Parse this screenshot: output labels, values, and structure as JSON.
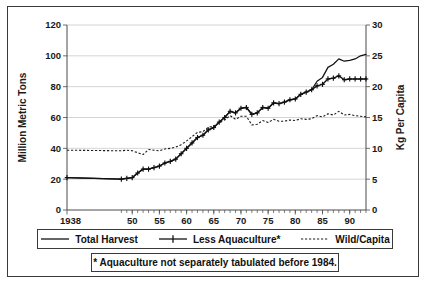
{
  "chart_data": {
    "type": "line",
    "title": "",
    "subtitle": "",
    "xlabel": "",
    "ylabel": "Million Metric Tons",
    "y2label": "Kg Per Capita",
    "xlim": [
      1938,
      1993
    ],
    "ylim": [
      0,
      120
    ],
    "y2lim": [
      0,
      30
    ],
    "grid": true,
    "legend_position": "bottom",
    "yticks": [
      0,
      20,
      40,
      60,
      80,
      100,
      120
    ],
    "yticklabels": [
      "0",
      "20",
      "40",
      "60",
      "80",
      "100",
      "120"
    ],
    "y2ticks": [
      0,
      5,
      10,
      15,
      20,
      25,
      30
    ],
    "y2ticklabels": [
      "0",
      "5",
      "10",
      "15",
      "20",
      "25",
      "30"
    ],
    "xticks": [
      1938,
      1950,
      1955,
      1960,
      1965,
      1970,
      1975,
      1980,
      1985,
      1990
    ],
    "xticklabels": [
      "1938",
      "50",
      "55",
      "60",
      "65",
      "70",
      "75",
      "80",
      "85",
      "90"
    ],
    "x_minor_step": 1,
    "annotation": "* Aquaculture not separately tabulated before 1984.",
    "series": [
      {
        "name": "Total Harvest",
        "axis": "left",
        "style": "solid",
        "marker": "none",
        "color": "#111111",
        "x": [
          1938,
          1948,
          1949,
          1950,
          1951,
          1952,
          1953,
          1954,
          1955,
          1956,
          1957,
          1958,
          1959,
          1960,
          1961,
          1962,
          1963,
          1964,
          1965,
          1966,
          1967,
          1968,
          1969,
          1970,
          1971,
          1972,
          1973,
          1974,
          1975,
          1976,
          1977,
          1978,
          1979,
          1980,
          1981,
          1982,
          1983,
          1984,
          1985,
          1986,
          1987,
          1988,
          1989,
          1990,
          1991,
          1992,
          1993
        ],
        "values": [
          21,
          20,
          20.5,
          21,
          24,
          26.5,
          26.5,
          27.5,
          28.5,
          30.5,
          31.5,
          33,
          36.5,
          40,
          43.5,
          47,
          48.5,
          52,
          53.5,
          57,
          60,
          64,
          63,
          66,
          66.5,
          62,
          63,
          66.5,
          66,
          69.5,
          69,
          70,
          71.5,
          72,
          75,
          76.5,
          78,
          83.5,
          86,
          92.5,
          94.5,
          98,
          96.5,
          97,
          98,
          100,
          101
        ]
      },
      {
        "name": "Less Aquaculture*",
        "axis": "left",
        "style": "solid",
        "marker": "plus",
        "color": "#111111",
        "x": [
          1938,
          1948,
          1949,
          1950,
          1951,
          1952,
          1953,
          1954,
          1955,
          1956,
          1957,
          1958,
          1959,
          1960,
          1961,
          1962,
          1963,
          1964,
          1965,
          1966,
          1967,
          1968,
          1969,
          1970,
          1971,
          1972,
          1973,
          1974,
          1975,
          1976,
          1977,
          1978,
          1979,
          1980,
          1981,
          1982,
          1983,
          1984,
          1985,
          1986,
          1987,
          1988,
          1989,
          1990,
          1991,
          1992,
          1993
        ],
        "values": [
          21,
          20,
          20.5,
          21,
          24,
          26.5,
          26.5,
          27.5,
          28.5,
          30.5,
          31.5,
          33,
          36.5,
          40,
          43.5,
          47,
          48.5,
          52,
          53.5,
          57,
          60,
          64,
          63,
          66,
          66.5,
          62,
          63,
          66.5,
          66,
          69.5,
          69,
          70,
          71.5,
          72,
          75,
          76.5,
          78,
          80.5,
          81.5,
          85,
          85.5,
          87,
          84.5,
          85,
          85,
          85,
          85
        ]
      },
      {
        "name": "Wild/Capita",
        "axis": "right",
        "style": "dotted",
        "marker": "none",
        "color": "#1a1a1a",
        "x": [
          1938,
          1948,
          1949,
          1950,
          1951,
          1952,
          1953,
          1954,
          1955,
          1956,
          1957,
          1958,
          1959,
          1960,
          1961,
          1962,
          1963,
          1964,
          1965,
          1966,
          1967,
          1968,
          1969,
          1970,
          1971,
          1972,
          1973,
          1974,
          1975,
          1976,
          1977,
          1978,
          1979,
          1980,
          1981,
          1982,
          1983,
          1984,
          1985,
          1986,
          1987,
          1988,
          1989,
          1990,
          1991,
          1992,
          1993
        ],
        "values": [
          9.7,
          9.6,
          9.7,
          9.6,
          9.3,
          9.0,
          9.8,
          9.7,
          9.6,
          9.9,
          10.0,
          10.2,
          10.6,
          11.2,
          11.9,
          12.6,
          12.7,
          13.4,
          13.6,
          14.2,
          14.6,
          15.3,
          14.7,
          15.2,
          15.2,
          13.8,
          13.9,
          14.5,
          14.2,
          14.7,
          14.4,
          14.4,
          14.6,
          14.5,
          14.8,
          14.7,
          14.8,
          15.3,
          15.1,
          15.6,
          15.4,
          16.0,
          15.4,
          15.5,
          15.3,
          15.2,
          15.1
        ]
      }
    ]
  },
  "legend": {
    "items": [
      {
        "label": "Total Harvest",
        "style": "solid",
        "marker": "none"
      },
      {
        "label": "Less Aquaculture*",
        "style": "solid",
        "marker": "plus"
      },
      {
        "label": "Wild/Capita",
        "style": "dotted",
        "marker": "none"
      }
    ]
  },
  "footnote": {
    "text": "* Aquaculture not separately tabulated before 1984."
  },
  "axes": {
    "left_title": "Million Metric Tons",
    "right_title": "Kg Per Capita"
  },
  "colors": {
    "frame": "#3a3a3a",
    "axis": "#4a4a4a",
    "grid": "#c9c9c9",
    "ink": "#111111",
    "background": "#ffffff"
  }
}
